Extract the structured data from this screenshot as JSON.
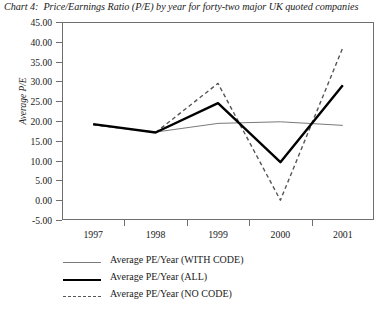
{
  "title": {
    "label": "Chart 4:",
    "text": "Price/Earnings Ratio (P/E) by year for forty-two major UK quoted companies"
  },
  "axes": {
    "ylabel": "Average P/E",
    "xlabel": "",
    "y_ticks": [
      "45.00",
      "40.00",
      "35.00",
      "30.00",
      "25.00",
      "20.00",
      "15.00",
      "10.00",
      "5.00",
      "0.00",
      "-5.00"
    ],
    "x_ticks": [
      "1997",
      "1998",
      "1999",
      "2000",
      "2001"
    ]
  },
  "legend": [
    {
      "label": "Average PE/Year (WITH CODE)",
      "style": "thin",
      "color": "#7a7a7a"
    },
    {
      "label": "Average PE/Year (ALL)",
      "style": "thick",
      "color": "#000000"
    },
    {
      "label": "Average PE/Year (NO CODE)",
      "style": "dashed",
      "color": "#555555"
    }
  ],
  "chart_data": {
    "type": "line",
    "xlabel": "",
    "ylabel": "Average P/E",
    "categories": [
      "1997",
      "1998",
      "1999",
      "2000",
      "2001"
    ],
    "ylim": [
      -5,
      45
    ],
    "ytick_step": 5,
    "grid": false,
    "legend_position": "below",
    "series": [
      {
        "name": "Average PE/Year (WITH CODE)",
        "style": "thin-solid",
        "color": "#7a7a7a",
        "values": [
          19.0,
          17.2,
          19.4,
          19.8,
          18.9
        ]
      },
      {
        "name": "Average PE/Year (ALL)",
        "style": "thick-solid",
        "color": "#000000",
        "values": [
          19.2,
          17.1,
          24.5,
          9.6,
          29.0
        ]
      },
      {
        "name": "Average PE/Year (NO CODE)",
        "style": "dashed",
        "color": "#555555",
        "values": [
          19.1,
          17.1,
          29.5,
          0.0,
          38.5
        ]
      }
    ]
  }
}
